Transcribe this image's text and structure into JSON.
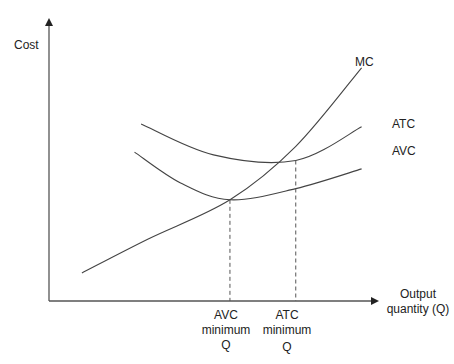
{
  "chart_data": {
    "type": "line",
    "title": "",
    "ylabel": "Cost",
    "xlabel": "Output quantity (Q)",
    "xlabel_lines": [
      "Output",
      "quantity (Q)"
    ],
    "grid": false,
    "legend": "inline curve labels at right end",
    "xlim": [
      0,
      10
    ],
    "ylim": [
      0,
      10
    ],
    "series": [
      {
        "name": "MC",
        "label": "MC",
        "points": [
          [
            1.0,
            1.0
          ],
          [
            3.0,
            2.2
          ],
          [
            5.5,
            3.6
          ],
          [
            7.5,
            5.5
          ],
          [
            9.5,
            8.3
          ]
        ]
      },
      {
        "name": "ATC",
        "label": "ATC",
        "points": [
          [
            2.8,
            6.3
          ],
          [
            5.0,
            5.2
          ],
          [
            7.5,
            5.0
          ],
          [
            9.5,
            6.2
          ]
        ]
      },
      {
        "name": "AVC",
        "label": "AVC",
        "points": [
          [
            2.6,
            5.3
          ],
          [
            4.0,
            4.2
          ],
          [
            5.5,
            3.6
          ],
          [
            7.5,
            4.0
          ],
          [
            9.5,
            4.7
          ]
        ]
      }
    ],
    "annotations": [
      {
        "x": 5.5,
        "y": 3.6,
        "lines": [
          "AVC",
          "minimum",
          "Q"
        ],
        "style": "dashed vertical to x-axis"
      },
      {
        "x": 7.5,
        "y": 5.0,
        "lines": [
          "ATC",
          "minimum",
          "Q"
        ],
        "style": "dashed vertical to x-axis"
      }
    ]
  }
}
